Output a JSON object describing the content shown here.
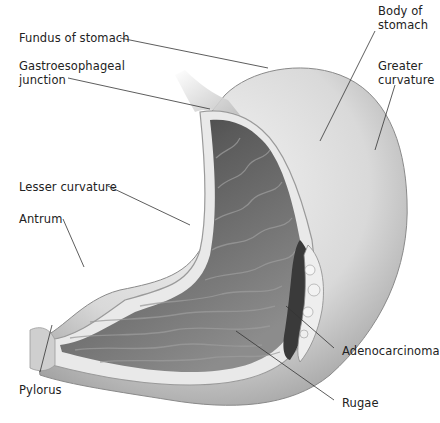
{
  "diagram": {
    "labels": {
      "fundus": "Fundus of stomach",
      "body": "Body of\nstomach",
      "ge_junction": "Gastroesophageal\njunction",
      "greater_curvature": "Greater\ncurvature",
      "lesser_curvature": "Lesser curvature",
      "antrum": "Antrum",
      "pylorus": "Pylorus",
      "adenocarcinoma": "Adenocarcinoma",
      "rugae": "Rugae"
    },
    "colors": {
      "background": "#ffffff",
      "text": "#222222",
      "leader_line": "#333333",
      "outer_wall": "#dcdcdc",
      "mucosa_dark": "#4a4a4a",
      "mucosa_mid": "#7a7a7a",
      "tumor": "#e6e6e6"
    }
  }
}
